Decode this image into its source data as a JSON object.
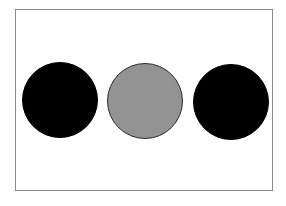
{
  "diagram": {
    "frame": {
      "border_color": "#8a8a8a",
      "background": "#ffffff"
    },
    "circles": [
      {
        "id": "left",
        "cx": 60,
        "cy": 100,
        "r": 38,
        "fill": "#000000",
        "stroke": "#000000"
      },
      {
        "id": "middle",
        "cx": 145,
        "cy": 101,
        "r": 38,
        "fill": "#939393",
        "stroke": "#2a2a2a"
      },
      {
        "id": "right",
        "cx": 231,
        "cy": 102,
        "r": 38,
        "fill": "#000000",
        "stroke": "#000000"
      }
    ]
  }
}
